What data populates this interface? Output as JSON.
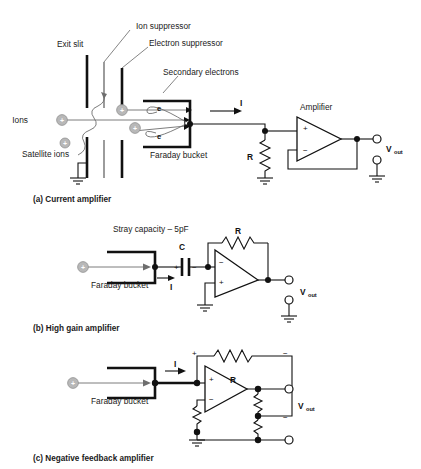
{
  "figure": {
    "panels": [
      {
        "id": "a",
        "caption": "(a) Current amplifier",
        "labels": {
          "exit_slit": "Exit slit",
          "ion_suppressor": "Ion suppressor",
          "electron_suppressor": "Electron suppressor",
          "secondary_electrons": "Secondary electrons",
          "ions": "Ions",
          "satellite_ions": "Satellite ions",
          "faraday_bucket": "Faraday bucket",
          "amplifier": "Amplifier",
          "current": "I",
          "resistor": "R",
          "vout": "V",
          "vout_sub": "out",
          "electron_1": "e",
          "electron_2": "e",
          "ion_charge": "+",
          "opamp_plus": "+",
          "opamp_minus": "−"
        }
      },
      {
        "id": "b",
        "caption": "(b) High gain amplifier",
        "labels": {
          "stray_capacity": "Stray capacity – 5pF",
          "capacitor": "C",
          "resistor": "R",
          "faraday_bucket": "Faraday bucket",
          "current": "I",
          "vout": "V",
          "vout_sub": "out",
          "cap_plus": "+",
          "cap_minus": "−",
          "opamp_plus": "+",
          "opamp_minus": "−",
          "ion_charge": "+"
        }
      },
      {
        "id": "c",
        "caption": "(c) Negative feedback amplifier",
        "labels": {
          "faraday_bucket": "Faraday bucket",
          "current": "I",
          "resistor": "R",
          "vout": "V",
          "vout_sub": "out",
          "fb_plus": "+",
          "fb_minus": "−",
          "div_minus": "−",
          "opamp_plus": "+",
          "opamp_minus": "−",
          "ion_charge": "+"
        }
      }
    ],
    "colors": {
      "ink": "#111111",
      "ion_fill": "#b8b8b8",
      "electron_trace": "#6e6e6e",
      "background": "#ffffff"
    }
  }
}
